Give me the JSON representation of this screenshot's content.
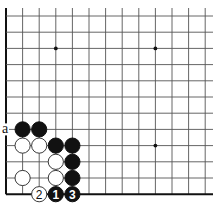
{
  "board": {
    "columns": 13,
    "rows": 12,
    "origin_x": 6,
    "origin_y": 16,
    "step_x": 16.6,
    "step_y": 16.2,
    "extend_right": 213,
    "extend_top": 8,
    "left_edge": true,
    "bottom_edge": true,
    "colors": {
      "black": "#111111",
      "white": "#ffffff",
      "line": "#555555"
    }
  },
  "star_points": [
    {
      "col": 3,
      "row": 2
    },
    {
      "col": 9,
      "row": 2
    },
    {
      "col": 9,
      "row": 8
    },
    {
      "col": 3,
      "row": 8
    }
  ],
  "stones": [
    {
      "color": "black",
      "col": 1,
      "row": 7
    },
    {
      "color": "black",
      "col": 2,
      "row": 7
    },
    {
      "color": "white",
      "col": 1,
      "row": 8
    },
    {
      "color": "white",
      "col": 2,
      "row": 8
    },
    {
      "color": "black",
      "col": 3,
      "row": 8
    },
    {
      "color": "black",
      "col": 4,
      "row": 8
    },
    {
      "color": "white",
      "col": 3,
      "row": 9
    },
    {
      "color": "black",
      "col": 4,
      "row": 9
    },
    {
      "color": "white",
      "col": 1,
      "row": 10
    },
    {
      "color": "white",
      "col": 3,
      "row": 10
    },
    {
      "color": "black",
      "col": 4,
      "row": 10
    },
    {
      "color": "white",
      "col": 2,
      "row": 11,
      "label": "2"
    },
    {
      "color": "black",
      "col": 3,
      "row": 11,
      "label": "1"
    },
    {
      "color": "black",
      "col": 4,
      "row": 11,
      "label": "3"
    }
  ],
  "point_labels": [
    {
      "text": "a",
      "col": 0,
      "row": 7,
      "offset_x": -1
    }
  ]
}
